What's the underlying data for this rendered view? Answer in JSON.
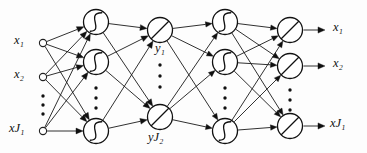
{
  "figure": {
    "width": 367,
    "height": 153,
    "background_color": "#fdfdfd",
    "stroke_color": "#111111"
  },
  "labels": {
    "input": [
      {
        "base": "x",
        "sub": "1",
        "subsub": ""
      },
      {
        "base": "x",
        "sub": "2",
        "subsub": ""
      },
      {
        "base": "x",
        "sub": "J",
        "subsub": "1"
      }
    ],
    "bottleneck": [
      {
        "base": "y",
        "sub": "1",
        "subsub": ""
      },
      {
        "base": "y",
        "sub": "J",
        "subsub": "2"
      }
    ],
    "output": [
      {
        "base": "x",
        "sub": "1",
        "subsub": ""
      },
      {
        "base": "x",
        "sub": "2",
        "subsub": ""
      },
      {
        "base": "x",
        "sub": "J",
        "subsub": "1"
      }
    ]
  },
  "label_text": {
    "input_1": "x₁",
    "input_2": "x₂",
    "input_J1": "xJ₁",
    "bottleneck_1": "y₁",
    "bottleneck_J2": "yJ₂",
    "output_1": "x₁",
    "output_2": "x₂",
    "output_J1": "xJ₁"
  },
  "layers": [
    {
      "name": "input-layer",
      "kind": "input",
      "x": 43,
      "node_radius": 3.6,
      "activation": "none",
      "nodes_y": [
        43,
        77,
        131
      ],
      "ellipsis_y": [
        96,
        105,
        114
      ],
      "ellipsis_x": 43
    },
    {
      "name": "hidden-layer-1",
      "kind": "hidden",
      "x": 96,
      "node_radius": 12.5,
      "activation": "sigmoid",
      "nodes_y": [
        22,
        62,
        131
      ],
      "ellipsis_y": [
        88,
        98,
        108
      ],
      "ellipsis_x": 96
    },
    {
      "name": "bottleneck-layer",
      "kind": "bottleneck",
      "x": 160,
      "node_radius": 12.5,
      "activation": "linear",
      "nodes_y": [
        30,
        117
      ],
      "ellipsis_y": [
        65,
        76,
        87
      ],
      "ellipsis_x": 160
    },
    {
      "name": "hidden-layer-3",
      "kind": "hidden",
      "x": 225,
      "node_radius": 12.5,
      "activation": "sigmoid",
      "nodes_y": [
        22,
        62,
        131
      ],
      "ellipsis_y": [
        88,
        98,
        108
      ],
      "ellipsis_x": 225
    },
    {
      "name": "output-layer",
      "kind": "output",
      "x": 290,
      "node_radius": 12.5,
      "activation": "linear",
      "nodes_y": [
        30,
        66,
        126
      ],
      "ellipsis_y": [
        90,
        100,
        110
      ],
      "ellipsis_x": 290
    }
  ],
  "output_arrows": {
    "from_dx": 13,
    "to_x": 325,
    "head_size": 5
  },
  "label_positions": {
    "input_1": {
      "left": 14,
      "top": 34
    },
    "input_2": {
      "left": 14,
      "top": 68
    },
    "input_J1": {
      "left": 9,
      "top": 122
    },
    "bottleneck_1": {
      "left": 155,
      "top": 42
    },
    "bottleneck_J2": {
      "left": 148,
      "top": 131
    },
    "output_1": {
      "left": 333,
      "top": 21
    },
    "output_2": {
      "left": 333,
      "top": 57
    },
    "output_J1": {
      "left": 330,
      "top": 117
    }
  }
}
